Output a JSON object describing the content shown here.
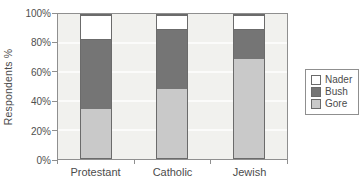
{
  "chart_data": {
    "type": "bar",
    "stacked": true,
    "units": "percent",
    "title": "",
    "ylabel": "Respondents %",
    "xlabel": "",
    "ylim": [
      0,
      100
    ],
    "yticks": [
      0,
      20,
      40,
      60,
      80,
      100
    ],
    "ytick_labels": [
      "0%",
      "20%",
      "40%",
      "60%",
      "80%",
      "100%"
    ],
    "grid": true,
    "legend_position": "right",
    "categories": [
      "Protestant",
      "Catholic",
      "Jewish"
    ],
    "series": [
      {
        "name": "Gore",
        "color": "#c9c9c9",
        "values": [
          34,
          48,
          69
        ]
      },
      {
        "name": "Bush",
        "color": "#757575",
        "values": [
          49,
          42,
          21
        ]
      },
      {
        "name": "Nader",
        "color": "#ffffff",
        "values": [
          17,
          10,
          10
        ]
      }
    ],
    "legend_order": [
      "Nader",
      "Bush",
      "Gore"
    ]
  },
  "colors": {
    "plot_background": "#f1f1ee",
    "gridline": "#fbfbfa",
    "axis": "#8f8f8f",
    "bar_border": "#6b6b6b",
    "text": "#4c4c4c"
  }
}
